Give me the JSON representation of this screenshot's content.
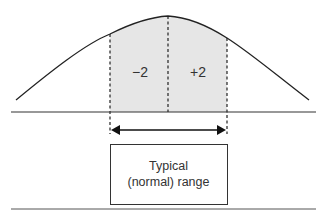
{
  "diagram": {
    "type": "normal-distribution",
    "regions": [
      {
        "label": "−2",
        "position": "left-of-mean"
      },
      {
        "label": "+2",
        "position": "right-of-mean"
      }
    ],
    "range_box": {
      "line1": "Typical",
      "line2": "(normal) range"
    },
    "colors": {
      "line": "#222222",
      "shade": "#e6e6e6",
      "text": "#333333"
    }
  }
}
